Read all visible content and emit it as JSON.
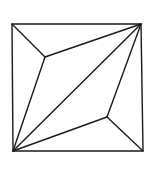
{
  "diagram": {
    "title": "",
    "stroke_color": "#1a1a1a",
    "background": "#ffffff",
    "square": {
      "x": 12,
      "y": 24,
      "width": 130,
      "height": 127
    },
    "vertices": {
      "top_left": [
        12,
        24
      ],
      "top_right": [
        141,
        24
      ],
      "bottom_left": [
        13,
        151
      ],
      "bottom_right": [
        143,
        151
      ],
      "inner_upper": [
        45,
        57
      ],
      "inner_lower": [
        107,
        117
      ]
    },
    "edges": [
      [
        "top_left",
        "inner_upper"
      ],
      [
        "inner_upper",
        "top_right"
      ],
      [
        "inner_upper",
        "bottom_left"
      ],
      [
        "bottom_left",
        "top_right"
      ],
      [
        "bottom_left",
        "inner_lower"
      ],
      [
        "inner_lower",
        "top_right"
      ],
      [
        "inner_lower",
        "bottom_right"
      ]
    ]
  }
}
